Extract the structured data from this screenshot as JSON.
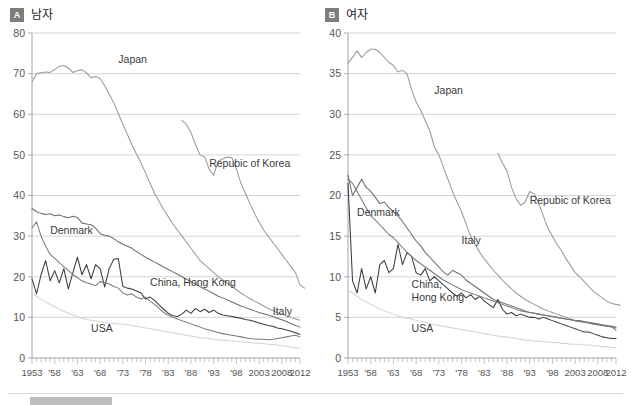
{
  "figure": {
    "background": "#ffffff",
    "panels": [
      {
        "badge": "A",
        "title": "남자"
      },
      {
        "badge": "B",
        "title": "여자"
      }
    ]
  },
  "chart_data": [
    {
      "panel": "A",
      "badge": "A",
      "title": "남자",
      "type": "line",
      "xlabel": "",
      "ylabel": "",
      "xlim": [
        1953,
        2012
      ],
      "ylim": [
        0,
        80
      ],
      "yticks": [
        0,
        10,
        20,
        30,
        40,
        50,
        60,
        70,
        80
      ],
      "xticks": [
        1953,
        1958,
        1963,
        1968,
        1973,
        1978,
        1983,
        1988,
        1993,
        1998,
        2003,
        2008,
        2012
      ],
      "xticklabels": [
        "1953",
        "'58",
        "'63",
        "'68",
        "'73",
        "'78",
        "'83",
        "'88",
        "'93",
        "'98",
        "2003",
        "2008",
        "2012"
      ],
      "grid": true,
      "legend_position": "inline-annotations",
      "series": [
        {
          "name": "Japan",
          "color": "#9a9a9a",
          "label_x": 1972,
          "label_y": 72.5,
          "x_start": 1953,
          "values": [
            68.0,
            70.0,
            70.2,
            70.4,
            70.3,
            71.0,
            71.8,
            72.0,
            71.4,
            70.3,
            70.7,
            71.0,
            70.2,
            69.0,
            69.3,
            68.8,
            67.0,
            65.0,
            62.8,
            60.2,
            57.5,
            55.0,
            52.5,
            50.2,
            48.0,
            45.5,
            43.0,
            40.5,
            38.5,
            36.5,
            34.8,
            33.0,
            31.5,
            30.0,
            28.5,
            27.0,
            25.5,
            24.0,
            23.0,
            22.0,
            21.0,
            20.0,
            19.2,
            18.4,
            17.6,
            16.8,
            16.0,
            15.3,
            14.6,
            14.0,
            13.4,
            12.8,
            12.2,
            11.7,
            11.2,
            10.8,
            10.4,
            10.0,
            9.6,
            9.3
          ]
        },
        {
          "name": "Repubic of Korea",
          "color": "#9a9a9a",
          "label_x": 1992,
          "label_y": 47.0,
          "x_start": 1986,
          "values": [
            58.5,
            57.5,
            55.5,
            52.5,
            50.0,
            49.5,
            46.5,
            45.0,
            48.5,
            49.0,
            49.5,
            49.3,
            46.5,
            43.0,
            40.5,
            38.0,
            35.5,
            33.5,
            31.5,
            30.0,
            28.5,
            27.0,
            25.5,
            24.0,
            22.5,
            21.0,
            18.0,
            17.2
          ]
        },
        {
          "name": "Denmark",
          "color": "#6e6e6e",
          "label_x": 1957,
          "label_y": 30.5,
          "x_start": 1953,
          "values": [
            36.8,
            36.0,
            35.6,
            35.3,
            35.5,
            35.0,
            35.2,
            34.8,
            34.5,
            34.9,
            34.6,
            33.2,
            33.0,
            32.8,
            32.0,
            30.6,
            30.2,
            30.0,
            29.4,
            28.6,
            28.0,
            27.5,
            27.0,
            26.2,
            25.5,
            24.8,
            24.2,
            23.6,
            23.0,
            22.4,
            21.8,
            21.2,
            20.6,
            20.0,
            19.4,
            18.8,
            18.2,
            17.6,
            17.0,
            16.4,
            15.8,
            15.2,
            14.8,
            14.3,
            13.8,
            13.3,
            12.8,
            12.4,
            12.0,
            11.6,
            11.2,
            10.9,
            10.6,
            10.2,
            9.8,
            9.4,
            9.0,
            8.5,
            8.0,
            7.6
          ]
        },
        {
          "name": "China, Hong Kong",
          "color": "#3c3c3c",
          "label_x": 1979,
          "label_y": 17.8,
          "x_start": 1953,
          "values": [
            19.5,
            15.8,
            20.5,
            24.0,
            19.0,
            21.5,
            18.5,
            22.0,
            17.0,
            21.0,
            24.8,
            20.5,
            23.0,
            19.5,
            23.0,
            22.0,
            17.5,
            22.0,
            24.3,
            24.5,
            17.6,
            17.2,
            17.0,
            16.5,
            16.0,
            14.5,
            15.0,
            14.2,
            13.0,
            12.0,
            11.0,
            10.4,
            10.2,
            10.8,
            11.8,
            11.0,
            12.2,
            11.4,
            12.0,
            11.2,
            11.8,
            11.0,
            10.6,
            10.4,
            10.2,
            10.0,
            9.8,
            9.5,
            9.3,
            9.0,
            8.6,
            8.3,
            8.0,
            7.8,
            7.4,
            7.2,
            6.9,
            6.6,
            6.2,
            5.8
          ]
        },
        {
          "name": "Italy",
          "color": "#7a7a7a",
          "label_x": 2006,
          "label_y": 10.5,
          "x_start": 1953,
          "values": [
            32.0,
            33.5,
            30.0,
            27.5,
            25.5,
            24.5,
            23.5,
            22.5,
            21.5,
            20.5,
            19.8,
            19.0,
            18.5,
            18.2,
            17.8,
            18.8,
            18.5,
            18.2,
            17.6,
            17.2,
            16.0,
            15.5,
            15.8,
            15.0,
            14.5,
            15.0,
            14.0,
            13.2,
            12.2,
            11.2,
            10.5,
            10.0,
            9.6,
            9.2,
            8.8,
            8.4,
            8.0,
            7.6,
            7.2,
            6.9,
            6.6,
            6.3,
            6.0,
            5.8,
            5.6,
            5.4,
            5.2,
            5.0,
            4.8,
            4.7,
            4.6,
            4.6,
            4.5,
            4.6,
            4.8,
            5.0,
            5.2,
            5.4,
            5.6,
            5.2
          ]
        },
        {
          "name": "USA",
          "color": "#d4d4d4",
          "label_x": 1966,
          "label_y": 6.5,
          "x_start": 1953,
          "values": [
            16.0,
            15.2,
            14.5,
            13.8,
            13.2,
            12.6,
            12.0,
            11.5,
            11.0,
            10.6,
            10.2,
            9.8,
            9.5,
            9.3,
            9.1,
            8.9,
            8.7,
            8.6,
            8.5,
            8.4,
            8.3,
            8.2,
            8.0,
            7.8,
            7.6,
            7.4,
            7.2,
            7.0,
            6.8,
            6.6,
            6.4,
            6.2,
            6.0,
            5.8,
            5.6,
            5.4,
            5.2,
            5.0,
            4.9,
            4.8,
            4.6,
            4.5,
            4.4,
            4.3,
            4.2,
            4.1,
            4.0,
            3.9,
            3.8,
            3.7,
            3.6,
            3.5,
            3.4,
            3.3,
            3.2,
            3.0,
            2.9,
            2.7,
            2.5,
            2.4
          ]
        }
      ]
    },
    {
      "panel": "B",
      "badge": "B",
      "title": "여자",
      "type": "line",
      "xlabel": "",
      "ylabel": "",
      "xlim": [
        1953,
        2012
      ],
      "ylim": [
        0,
        40
      ],
      "yticks": [
        0,
        5,
        10,
        15,
        20,
        25,
        30,
        35,
        40
      ],
      "xticks": [
        1953,
        1958,
        1963,
        1968,
        1973,
        1978,
        1983,
        1988,
        1993,
        1998,
        2003,
        2008,
        2012
      ],
      "xticklabels": [
        "1953",
        "'58",
        "'63",
        "'68",
        "'73",
        "'78",
        "'83",
        "'88",
        "'93",
        "'98",
        "2003",
        "2008",
        "2012"
      ],
      "grid": true,
      "legend_position": "inline-annotations",
      "series": [
        {
          "name": "Japan",
          "color": "#9a9a9a",
          "label_x": 1972,
          "label_y": 32.5,
          "x_start": 1953,
          "values": [
            36.3,
            37.0,
            37.8,
            37.0,
            37.6,
            38.0,
            38.0,
            37.6,
            37.0,
            36.4,
            36.0,
            35.2,
            35.4,
            35.0,
            33.0,
            31.5,
            30.5,
            29.2,
            28.0,
            26.0,
            25.0,
            23.5,
            22.0,
            20.5,
            19.2,
            18.0,
            16.5,
            15.0,
            14.0,
            13.0,
            12.2,
            11.5,
            10.8,
            10.2,
            9.6,
            9.0,
            8.5,
            8.0,
            7.6,
            7.2,
            6.9,
            6.6,
            6.3,
            6.0,
            5.8,
            5.6,
            5.4,
            5.2,
            5.0,
            4.8,
            4.6,
            4.5,
            4.4,
            4.3,
            4.2,
            4.1,
            4.0,
            3.9,
            3.8,
            3.7
          ]
        },
        {
          "name": "Repubic of Korea",
          "color": "#9a9a9a",
          "label_x": 1993,
          "label_y": 19.0,
          "x_start": 1986,
          "values": [
            25.2,
            24.0,
            23.0,
            21.0,
            19.6,
            18.8,
            19.2,
            20.5,
            20.2,
            19.0,
            17.5,
            16.0,
            15.0,
            14.0,
            13.2,
            12.2,
            11.4,
            10.5,
            10.0,
            9.4,
            8.8,
            8.2,
            7.8,
            7.4,
            7.0,
            6.7,
            6.6,
            6.5
          ]
        },
        {
          "name": "Denmark",
          "color": "#6e6e6e",
          "label_x": 1955,
          "label_y": 17.5,
          "x_start": 1953,
          "values": [
            22.5,
            20.0,
            21.0,
            22.0,
            21.0,
            20.5,
            19.8,
            19.0,
            19.2,
            18.5,
            18.0,
            17.5,
            16.8,
            16.0,
            15.2,
            14.4,
            13.8,
            13.0,
            12.4,
            11.8,
            11.2,
            10.6,
            10.2,
            10.8,
            10.5,
            10.2,
            9.6,
            9.2,
            8.8,
            8.4,
            8.0,
            7.6,
            7.2,
            7.0,
            6.8,
            6.6,
            6.4,
            6.2,
            6.0,
            5.8,
            5.6,
            5.5,
            5.4,
            5.3,
            5.2,
            5.1,
            5.0,
            4.9,
            4.8,
            4.7,
            4.6,
            4.5,
            4.4,
            4.3,
            4.2,
            4.1,
            4.0,
            3.9,
            3.9,
            3.8
          ]
        },
        {
          "name": "China, Hong Kong",
          "color": "#3c3c3c",
          "label_x": 1967,
          "label_y": 8.6,
          "x_start": 1953,
          "values": [
            21.5,
            9.5,
            8.0,
            11.0,
            8.5,
            10.0,
            8.0,
            11.5,
            12.0,
            10.5,
            11.0,
            14.0,
            11.5,
            13.0,
            12.5,
            10.5,
            10.2,
            11.0,
            9.5,
            10.0,
            9.5,
            9.0,
            8.5,
            8.0,
            7.6,
            8.0,
            7.4,
            7.8,
            7.2,
            7.6,
            7.0,
            6.6,
            6.2,
            7.2,
            6.0,
            5.4,
            5.6,
            5.2,
            5.4,
            5.2,
            5.0,
            5.0,
            4.8,
            5.0,
            4.8,
            4.6,
            4.4,
            4.2,
            4.0,
            3.8,
            3.6,
            3.4,
            3.2,
            3.2,
            3.0,
            2.8,
            2.6,
            2.5,
            2.4,
            2.4
          ]
        },
        {
          "name": "Italy",
          "color": "#7a7a7a",
          "label_x": 1978,
          "label_y": 14.0,
          "x_start": 1953,
          "values": [
            22.0,
            21.5,
            20.5,
            19.5,
            18.5,
            17.5,
            17.0,
            16.4,
            15.8,
            15.2,
            14.8,
            14.2,
            13.6,
            13.0,
            12.5,
            12.0,
            11.6,
            11.2,
            10.8,
            10.4,
            10.0,
            9.6,
            9.3,
            9.0,
            8.7,
            8.4,
            8.2,
            8.0,
            7.8,
            7.6,
            7.4,
            7.2,
            7.0,
            6.8,
            6.6,
            6.4,
            6.2,
            6.0,
            5.8,
            5.7,
            5.6,
            5.5,
            5.4,
            5.3,
            5.2,
            5.1,
            5.0,
            4.9,
            4.8,
            4.7,
            4.6,
            4.6,
            4.5,
            4.4,
            4.3,
            4.2,
            4.1,
            4.0,
            3.9,
            3.4
          ]
        },
        {
          "name": "USA",
          "color": "#d4d4d4",
          "label_x": 1967,
          "label_y": 3.2,
          "x_start": 1953,
          "values": [
            8.4,
            8.0,
            7.6,
            7.2,
            6.9,
            6.6,
            6.3,
            6.0,
            5.8,
            5.6,
            5.4,
            5.2,
            5.0,
            4.9,
            4.8,
            4.6,
            4.5,
            4.4,
            4.2,
            4.1,
            4.0,
            3.9,
            3.8,
            3.7,
            3.6,
            3.5,
            3.4,
            3.3,
            3.2,
            3.1,
            3.0,
            2.9,
            2.8,
            2.7,
            2.6,
            2.6,
            2.5,
            2.4,
            2.3,
            2.2,
            2.2,
            2.1,
            2.1,
            2.0,
            2.0,
            1.9,
            1.9,
            1.8,
            1.8,
            1.7,
            1.7,
            1.7,
            1.6,
            1.6,
            1.5,
            1.5,
            1.4,
            1.4,
            1.3,
            1.3
          ]
        }
      ]
    }
  ]
}
